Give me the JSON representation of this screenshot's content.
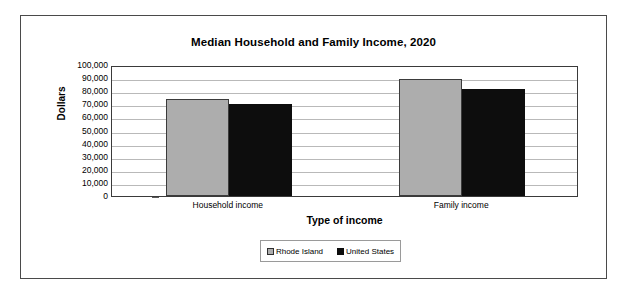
{
  "chart_data": {
    "type": "bar",
    "title": "Median Household and Family Income, 2020",
    "xlabel": "Type of income",
    "ylabel": "Dollars",
    "categories": [
      "Household income",
      "Family income"
    ],
    "series": [
      {
        "name": "Rhode Island",
        "color": "#adadad",
        "values": [
          74000,
          89000
        ]
      },
      {
        "name": "United States",
        "color": "#0d0d0d",
        "values": [
          70000,
          81500
        ]
      }
    ],
    "ylim": [
      0,
      100000
    ],
    "ytick_labels": [
      "100,000",
      "90,000",
      "80,000",
      "70,000",
      "60,000",
      "50,000",
      "40,000",
      "30,000",
      "20,000",
      "10,000",
      "0"
    ],
    "ytick_values": [
      100000,
      90000,
      80000,
      70000,
      60000,
      50000,
      40000,
      30000,
      20000,
      10000,
      0
    ],
    "grid": true,
    "legend_position": "bottom"
  },
  "legend": {
    "entries": [
      {
        "label": "Rhode Island"
      },
      {
        "label": "United States"
      }
    ]
  }
}
